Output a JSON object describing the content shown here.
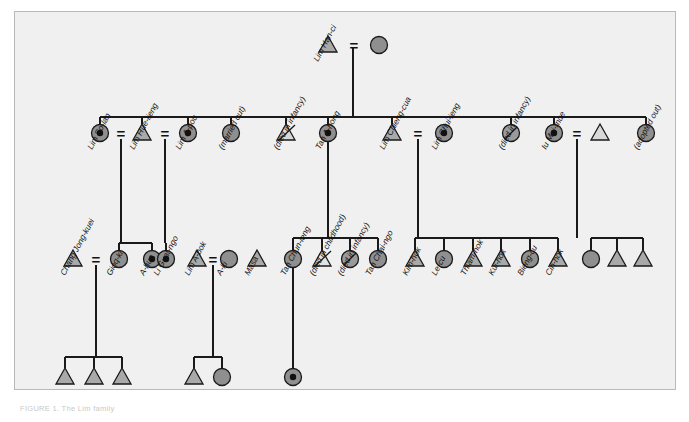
{
  "figure": {
    "caption": "FIGURE 1. The Lim family",
    "panel_bg": "#f0f0f0",
    "panel_border": "#b9b9b9"
  },
  "legend_colors": {
    "male_fill": "#a9a9a9",
    "female_fill": "#8f8f8f",
    "line": "#1a1a1a",
    "dot": "#111111"
  },
  "symbols": {
    "male": "triangle",
    "female": "circle",
    "focal_female": "circle-with-dot",
    "deceased_male": "triangle-slashed",
    "deceased_female": "circle-slashed",
    "marriage": "="
  },
  "generations": {
    "g1": {
      "label": "generation-1",
      "people": [
        {
          "id": "g1-m",
          "name": "Lim Han-ci",
          "sex": "male",
          "symbol": "triangle",
          "x": 328,
          "y": 45
        },
        {
          "id": "g1-f",
          "name": "",
          "sex": "female",
          "symbol": "circle",
          "x": 379,
          "y": 45
        }
      ],
      "marriages": [
        {
          "a": "g1-m",
          "b": "g1-f",
          "glyph": "="
        }
      ]
    },
    "g2": {
      "label": "generation-2",
      "people": [
        {
          "id": "so-lan",
          "name": "Lim So-lan",
          "sex": "female",
          "symbol": "circle-with-dot",
          "x": 100,
          "y": 133
        },
        {
          "id": "hue-lieng",
          "name": "Lim Hue-lieng",
          "sex": "male",
          "symbol": "triangle",
          "x": 142,
          "y": 133
        },
        {
          "id": "a-pou",
          "name": "Lim A-pou",
          "sex": "female",
          "symbol": "circle-with-dot",
          "x": 188,
          "y": 133
        },
        {
          "id": "marr-out",
          "name": "(married out)",
          "sex": "female",
          "symbol": "circle",
          "x": 231,
          "y": 133
        },
        {
          "id": "inf-1",
          "name": "(died in infancy)",
          "sex": "male",
          "symbol": "triangle-slashed",
          "x": 286,
          "y": 133
        },
        {
          "id": "a-hong",
          "name": "Tan A-hong",
          "sex": "female",
          "symbol": "circle-with-dot",
          "x": 328,
          "y": 133
        },
        {
          "id": "chieng",
          "name": "Lim Chieng-cua",
          "sex": "male",
          "symbol": "triangle",
          "x": 392,
          "y": 133
        },
        {
          "id": "chui-ieng",
          "name": "Lim Chui-ieng",
          "sex": "female",
          "symbol": "circle-with-dot",
          "x": 444,
          "y": 133
        },
        {
          "id": "inf-2",
          "name": "(died in infancy)",
          "sex": "female",
          "symbol": "circle-slashed",
          "x": 511,
          "y": 133
        },
        {
          "id": "mui-mue",
          "name": "Iu Mui-mue",
          "sex": "female",
          "symbol": "circle-with-dot",
          "x": 554,
          "y": 133
        },
        {
          "id": "mui-sp",
          "name": "",
          "sex": "male",
          "symbol": "triangle",
          "x": 600,
          "y": 133
        },
        {
          "id": "adopt-out",
          "name": "(adopted out)",
          "sex": "female",
          "symbol": "circle",
          "x": 646,
          "y": 133
        }
      ],
      "marriages": [
        {
          "a": "so-lan",
          "b": "hue-lieng",
          "glyph": "="
        },
        {
          "a": "hue-lieng",
          "b": "a-pou",
          "glyph": "="
        },
        {
          "a": "chieng",
          "b": "chui-ieng",
          "glyph": "="
        },
        {
          "a": "mui-mue",
          "b": "mui-sp",
          "glyph": "="
        }
      ]
    },
    "g3": {
      "label": "generation-3",
      "people": [
        {
          "id": "jong-kuei",
          "name": "Chang Jong-kuei",
          "sex": "male",
          "symbol": "triangle",
          "x": 73,
          "y": 259
        },
        {
          "id": "gioq-ki",
          "name": "Gioq-ki",
          "sex": "female",
          "symbol": "circle",
          "x": 119,
          "y": 259
        },
        {
          "id": "a-hua",
          "name": "A-hua",
          "sex": "female",
          "symbol": "circle-with-dot",
          "x": 152,
          "y": 259
        },
        {
          "id": "guat-ngo",
          "name": "Li Guat-ngo",
          "sex": "female",
          "symbol": "circle-with-dot",
          "x": 166,
          "y": 259
        },
        {
          "id": "a-bok",
          "name": "Lim A-bok",
          "sex": "male",
          "symbol": "triangle",
          "x": 197,
          "y": 259
        },
        {
          "id": "a-ki",
          "name": "A-ki",
          "sex": "female",
          "symbol": "circle",
          "x": 229,
          "y": 259
        },
        {
          "id": "masa",
          "name": "Masa",
          "sex": "male",
          "symbol": "triangle",
          "x": 257,
          "y": 259
        },
        {
          "id": "chun-ieng",
          "name": "Tan Chun-ieng",
          "sex": "female",
          "symbol": "circle",
          "x": 293,
          "y": 259
        },
        {
          "id": "child-d",
          "name": "(died in childhood)",
          "sex": "male",
          "symbol": "triangle-slashed",
          "x": 322,
          "y": 259
        },
        {
          "id": "inf-3",
          "name": "(died in infancy)",
          "sex": "female",
          "symbol": "circle-slashed",
          "x": 350,
          "y": 259
        },
        {
          "id": "chai-ngo",
          "name": "Tan Chai-ngo",
          "sex": "female",
          "symbol": "circle",
          "x": 378,
          "y": 259
        },
        {
          "id": "kim-hok",
          "name": "Kim-hok",
          "sex": "male",
          "symbol": "triangle",
          "x": 415,
          "y": 259
        },
        {
          "id": "le-cu",
          "name": "Le-cu",
          "sex": "female",
          "symbol": "circle",
          "x": 444,
          "y": 259
        },
        {
          "id": "thiam-hok",
          "name": "Thiam-hok",
          "sex": "male",
          "symbol": "triangle",
          "x": 473,
          "y": 259
        },
        {
          "id": "kui-hok",
          "name": "Kui-hok",
          "sex": "male",
          "symbol": "triangle",
          "x": 501,
          "y": 259
        },
        {
          "id": "bieng-cu",
          "name": "Bieng-cu",
          "sex": "female",
          "symbol": "circle",
          "x": 530,
          "y": 259
        },
        {
          "id": "cin-hok",
          "name": "Cin-hok",
          "sex": "male",
          "symbol": "triangle",
          "x": 558,
          "y": 259
        },
        {
          "id": "mm-c1",
          "name": "",
          "sex": "female",
          "symbol": "circle",
          "x": 591,
          "y": 259
        },
        {
          "id": "mm-c2",
          "name": "",
          "sex": "male",
          "symbol": "triangle",
          "x": 617,
          "y": 259
        },
        {
          "id": "mm-c3",
          "name": "",
          "sex": "male",
          "symbol": "triangle",
          "x": 643,
          "y": 259
        }
      ],
      "marriages": [
        {
          "a": "jong-kuei",
          "b": "gioq-ki",
          "glyph": "="
        },
        {
          "a": "a-bok",
          "b": "a-ki",
          "glyph": "="
        }
      ]
    },
    "g4": {
      "label": "generation-4",
      "people": [
        {
          "id": "g4-a1",
          "name": "",
          "sex": "male",
          "symbol": "triangle",
          "x": 65,
          "y": 377
        },
        {
          "id": "g4-a2",
          "name": "",
          "sex": "male",
          "symbol": "triangle",
          "x": 94,
          "y": 377
        },
        {
          "id": "g4-a3",
          "name": "",
          "sex": "male",
          "symbol": "triangle",
          "x": 122,
          "y": 377
        },
        {
          "id": "g4-b1",
          "name": "",
          "sex": "male",
          "symbol": "triangle",
          "x": 194,
          "y": 377
        },
        {
          "id": "g4-b2",
          "name": "",
          "sex": "female",
          "symbol": "circle",
          "x": 222,
          "y": 377
        },
        {
          "id": "g4-c1",
          "name": "",
          "sex": "female",
          "symbol": "circle-with-dot",
          "x": 293,
          "y": 377
        }
      ],
      "marriages": []
    }
  }
}
